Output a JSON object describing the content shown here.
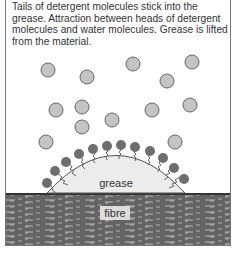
{
  "caption": "Tails of detergent molecules stick into the grease. Attraction between heads of detergent molecules and water molecules. Grease is lifted from the material.",
  "labels": {
    "grease": "grease",
    "fibre": "fibre"
  },
  "colors": {
    "water": "#c4c4c4",
    "detergent_head": "#6e6e6e",
    "grease": "#ececec",
    "fibre": "#555555",
    "stroke": "#555555"
  },
  "water_molecules": [
    [
      48,
      70
    ],
    [
      87,
      77
    ],
    [
      133,
      64
    ],
    [
      192,
      62
    ],
    [
      167,
      81
    ],
    [
      56,
      110
    ],
    [
      82,
      107
    ],
    [
      152,
      110
    ],
    [
      190,
      105
    ],
    [
      112,
      120
    ],
    [
      82,
      127
    ],
    [
      46,
      142
    ],
    [
      175,
      142
    ]
  ]
}
